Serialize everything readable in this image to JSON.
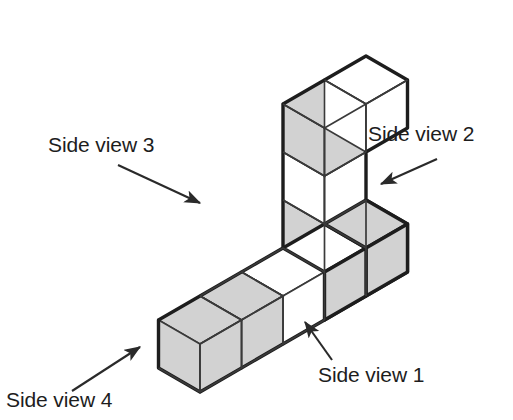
{
  "figure": {
    "colors": {
      "background": "#ffffff",
      "face_shaded": "#d2d2d2",
      "face_light": "#ffffff",
      "outline": "#1d1d1d",
      "inner_line": "#3a3a3a",
      "text": "#1d1d1d",
      "arrow": "#2a2a2a"
    },
    "geometry": {
      "projection": "isometric",
      "cube_edge_px": 48,
      "axis_x_step": [
        41.5,
        24
      ],
      "axis_y_step": [
        -41.5,
        24
      ],
      "axis_z_step": [
        0,
        -48
      ],
      "origin": [
        200.0,
        368.0
      ],
      "cube_count": 8
    },
    "cubes": [
      {
        "id": "base-1",
        "grid": [
          0,
          0,
          0
        ],
        "note": "front-left end of bottom row"
      },
      {
        "id": "base-2",
        "grid": [
          1,
          0,
          0
        ],
        "note": "bottom row"
      },
      {
        "id": "base-3",
        "grid": [
          2,
          0,
          0
        ],
        "note": "bottom row"
      },
      {
        "id": "base-4",
        "grid": [
          3,
          0,
          0
        ],
        "note": "right end of bottom row, base of column"
      },
      {
        "id": "col-1",
        "grid": [
          3,
          0,
          1
        ],
        "note": "column level 1"
      },
      {
        "id": "col-2",
        "grid": [
          3,
          0,
          2
        ],
        "note": "column level 2"
      },
      {
        "id": "col-3",
        "grid": [
          3,
          0,
          3
        ],
        "note": "column top cube"
      },
      {
        "id": "top-back",
        "grid": [
          3,
          1,
          3
        ],
        "note": "cube extending back from column top"
      }
    ]
  },
  "labels": {
    "side_view_1": "Side view 1",
    "side_view_2": "Side view 2",
    "side_view_3": "Side view 3",
    "side_view_4": "Side view 4"
  },
  "arrows": [
    {
      "id": "arrow-side-view-1",
      "from": [
        330,
        362
      ],
      "to": [
        303,
        322
      ],
      "points_to": "front-right lower face of bottom row"
    },
    {
      "id": "arrow-side-view-2",
      "from": [
        437,
        160
      ],
      "to": [
        378,
        186
      ],
      "points_to": "right face of the structure"
    },
    {
      "id": "arrow-side-view-3",
      "from": [
        118,
        165
      ],
      "to": [
        203,
        205
      ],
      "points_to": "back-left face of the column"
    },
    {
      "id": "arrow-side-view-4",
      "from": [
        72,
        390
      ],
      "to": [
        143,
        345
      ],
      "points_to": "front-left lower face of bottom row"
    }
  ]
}
